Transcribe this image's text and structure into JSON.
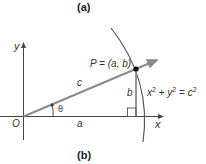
{
  "figure": {
    "panel_top_label": "(a)",
    "panel_bottom_label": "(b)"
  },
  "axes": {
    "x_label": "x",
    "y_label": "y",
    "origin_label": "O"
  },
  "triangle": {
    "hypotenuse_label": "c",
    "adjacent_label": "a",
    "opposite_label": "b",
    "angle_label": "θ"
  },
  "point": {
    "label": "P = (a, b)"
  },
  "circle": {
    "equation_x": "x",
    "equation_plus": " + ",
    "equation_y": "y",
    "equation_eq": " = ",
    "equation_c": "c",
    "exponent": "2"
  },
  "colors": {
    "axis": "#444444",
    "ray": "#8a8a8a",
    "arc": "#555555",
    "point": "#000000"
  }
}
